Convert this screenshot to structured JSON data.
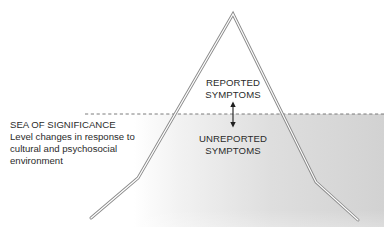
{
  "diagram": {
    "type": "iceberg",
    "above_water_label": [
      "REPORTED",
      "SYMPTOMS"
    ],
    "below_water_label": [
      "UNREPORTED",
      "SYMPTOMS"
    ],
    "sea_label": {
      "heading": "SEA OF SIGNIFICANCE",
      "description_lines": [
        "Level changes in response to",
        "cultural and psychosocial",
        "environment"
      ]
    },
    "arrow": "double-headed vertical arrow across waterline",
    "waterline": "dashed",
    "colors": {
      "outline": "#8a8a8a",
      "outline_fill": "#ffffff",
      "sea_start": "#ffffff",
      "sea_end": "#d4d4d4",
      "dash": "#707070",
      "text": "#2b2b2b"
    }
  }
}
